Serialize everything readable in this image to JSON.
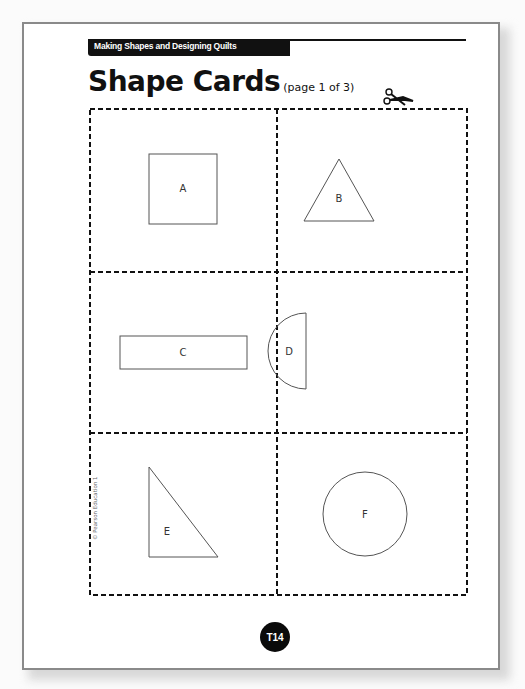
{
  "header": {
    "series_label": "Making Shapes and Designing Quilts"
  },
  "title": {
    "main": "Shape Cards",
    "page_indicator": "(page 1 of 3)"
  },
  "cards": [
    {
      "label": "A",
      "shape": "square"
    },
    {
      "label": "B",
      "shape": "equilateral-triangle"
    },
    {
      "label": "C",
      "shape": "rectangle"
    },
    {
      "label": "D",
      "shape": "semicircle"
    },
    {
      "label": "E",
      "shape": "right-triangle"
    },
    {
      "label": "F",
      "shape": "circle"
    }
  ],
  "footer": {
    "copyright": "© Pearson Education 1",
    "page_number": "T14"
  },
  "icons": {
    "cut_guide": "scissors-icon"
  }
}
